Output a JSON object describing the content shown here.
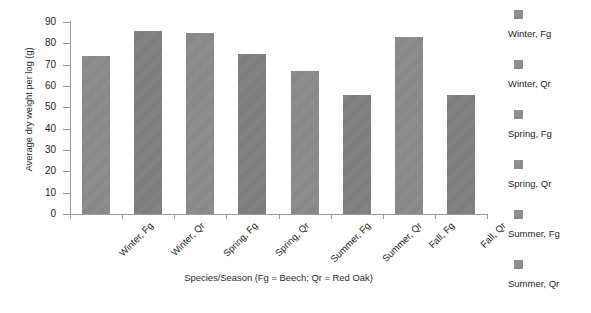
{
  "chart_data": {
    "type": "bar",
    "title": "",
    "subtitle": "",
    "xlabel": "Species/Season (Fg = Beech; Qr = Red Oak)",
    "ylabel": "Average dry weight per log (g)",
    "categories": [
      "Winter, Fg",
      "Winter, Qr",
      "Spring, Fg",
      "Spring, Qr",
      "Summer, Fg",
      "Summer, Qr",
      "Fall, Fg",
      "Fall, Qr"
    ],
    "values": [
      74,
      86,
      85,
      75,
      67,
      56,
      83,
      56
    ],
    "ylim": [
      0,
      90
    ],
    "ytick_labels": [
      "90",
      "80",
      "70",
      "60",
      "50",
      "40",
      "30",
      "20",
      "10",
      "0"
    ],
    "ytick_values": [
      90,
      80,
      70,
      60,
      50,
      40,
      30,
      20,
      10,
      0
    ],
    "ytick_step": 10,
    "grid": false,
    "legend_position": "right",
    "legend_entries": [
      "Winter, Fg",
      "Winter, Qr",
      "Spring, Fg",
      "Spring, Qr",
      "Summer, Fg",
      "Summer, Qr"
    ],
    "bar_color": "#8a8a8a",
    "axis_color": "#9a9a9a"
  },
  "axis": {
    "y_title": "Average dry weight per log (g)",
    "x_title": "Species/Season (Fg = Beech; Qr = Red Oak)"
  },
  "yticks": [
    {
      "label": "90"
    },
    {
      "label": "80"
    },
    {
      "label": "70"
    },
    {
      "label": "60"
    },
    {
      "label": "50"
    },
    {
      "label": "40"
    },
    {
      "label": "30"
    },
    {
      "label": "20"
    },
    {
      "label": "10"
    },
    {
      "label": "0"
    }
  ],
  "bars": [
    {
      "label": "Winter, Fg",
      "value": 74
    },
    {
      "label": "Winter, Qr",
      "value": 86
    },
    {
      "label": "Spring, Fg",
      "value": 85
    },
    {
      "label": "Spring, Qr",
      "value": 75
    },
    {
      "label": "Summer, Fg",
      "value": 67
    },
    {
      "label": "Summer, Qr",
      "value": 56
    },
    {
      "label": "Fall, Fg",
      "value": 83
    },
    {
      "label": "Fall, Qr",
      "value": 56
    }
  ],
  "legend": {
    "items": [
      {
        "label": "Winter, Fg"
      },
      {
        "label": "Winter, Qr"
      },
      {
        "label": "Spring, Fg"
      },
      {
        "label": "Spring, Qr"
      },
      {
        "label": "Summer, Fg"
      },
      {
        "label": "Summer, Qr"
      }
    ]
  }
}
